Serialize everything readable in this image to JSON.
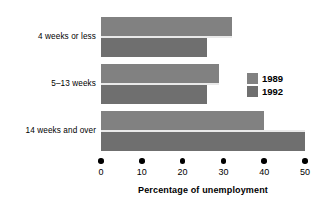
{
  "chart_data": {
    "type": "bar",
    "orientation": "horizontal",
    "title": "",
    "xlabel": "Percentage of unemployment",
    "ylabel": "",
    "xlim": [
      0,
      50
    ],
    "xticks": [
      0,
      10,
      20,
      30,
      40,
      50
    ],
    "xticklabels": [
      "0",
      "10",
      "20",
      "30",
      "40",
      "50"
    ],
    "grid": false,
    "legend_position": "right",
    "categories": [
      "4 weeks or less",
      "5–13 weeks",
      "14 weeks and over"
    ],
    "series": [
      {
        "name": "1989",
        "color": "#818181",
        "values": [
          32,
          29,
          40
        ]
      },
      {
        "name": "1992",
        "color": "#6f6f6f",
        "values": [
          26,
          26,
          50
        ]
      }
    ]
  },
  "legend": {
    "entries": [
      {
        "label": "1989"
      },
      {
        "label": "1992"
      }
    ]
  }
}
